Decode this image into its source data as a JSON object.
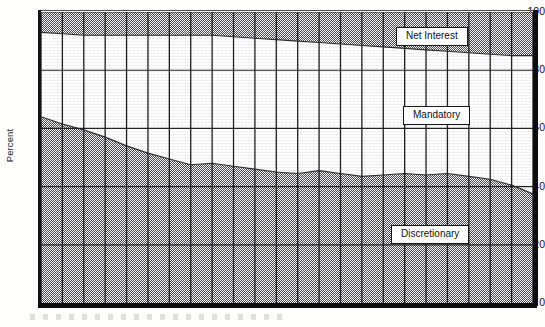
{
  "chart_data": {
    "type": "area",
    "stacked": true,
    "title": "",
    "subtitle": "",
    "xlabel": "",
    "ylabel": "Percent",
    "ylim": [
      0,
      100
    ],
    "xlim": [
      0,
      23
    ],
    "yticks": [
      0,
      20,
      40,
      60,
      80,
      100
    ],
    "ytick_labels": [
      "0",
      "20",
      "40",
      "60",
      "80",
      "100"
    ],
    "xtick_labels": [],
    "grid": "both",
    "gridlines_vertical": 24,
    "legend_position": "inline-labels",
    "annotations": [
      "Net Interest",
      "Mandatory",
      "Discretionary"
    ],
    "colors": {
      "discretionary": "#9a9a9a",
      "mandatory": "#ffffff",
      "net_interest": "#9a9a9a",
      "axis": "#141417",
      "grid": "#2b2b2f",
      "background": "#fdfdfb"
    },
    "x": [
      0,
      1,
      2,
      3,
      4,
      5,
      6,
      7,
      8,
      9,
      10,
      11,
      12,
      13,
      14,
      15,
      16,
      17,
      18,
      19,
      20,
      21,
      22,
      23
    ],
    "series": [
      {
        "name": "Discretionary",
        "stack_order": 1,
        "values": [
          64.0,
          61.5,
          59.5,
          57.0,
          54.0,
          51.5,
          49.5,
          47.5,
          48.0,
          47.0,
          46.0,
          45.0,
          44.5,
          45.5,
          44.5,
          43.5,
          44.0,
          44.5,
          44.0,
          44.5,
          43.5,
          42.5,
          40.5,
          37.5
        ]
      },
      {
        "name": "Mandatory",
        "stack_order": 2,
        "values": [
          29.0,
          31.0,
          32.5,
          35.0,
          38.0,
          40.5,
          42.5,
          44.5,
          44.0,
          44.5,
          45.0,
          45.5,
          45.5,
          44.0,
          44.5,
          45.0,
          44.0,
          43.0,
          43.0,
          42.0,
          42.5,
          43.0,
          44.5,
          47.5
        ]
      },
      {
        "name": "Net Interest",
        "stack_order": 3,
        "values": [
          7.0,
          7.5,
          8.0,
          8.0,
          8.0,
          8.0,
          8.0,
          8.0,
          8.0,
          8.5,
          9.0,
          9.5,
          10.0,
          10.5,
          11.0,
          11.5,
          12.0,
          12.5,
          13.0,
          13.5,
          14.0,
          14.5,
          15.0,
          15.0
        ]
      }
    ],
    "cumulative_upper_boundaries": {
      "discretionary_top": [
        64.0,
        61.5,
        59.5,
        57.0,
        54.0,
        51.5,
        49.5,
        47.5,
        48.0,
        47.0,
        46.0,
        45.0,
        44.5,
        45.5,
        44.5,
        43.5,
        44.0,
        44.5,
        44.0,
        44.5,
        43.5,
        42.5,
        40.5,
        37.5
      ],
      "mandatory_top": [
        93.0,
        92.5,
        92.0,
        92.0,
        92.0,
        92.0,
        92.0,
        92.0,
        92.0,
        91.5,
        91.0,
        90.5,
        90.0,
        89.5,
        89.0,
        88.5,
        88.0,
        87.5,
        87.0,
        86.5,
        86.0,
        85.5,
        85.0,
        85.0
      ]
    }
  },
  "axis": {
    "y_label": "Percent",
    "ticks": [
      {
        "value": "100"
      },
      {
        "value": "80"
      },
      {
        "value": "60"
      },
      {
        "value": "40"
      },
      {
        "value": "20"
      },
      {
        "value": "0"
      }
    ]
  },
  "labels": {
    "net_interest": "Net Interest",
    "mandatory": "Mandatory",
    "discretionary": "Discretionary"
  }
}
